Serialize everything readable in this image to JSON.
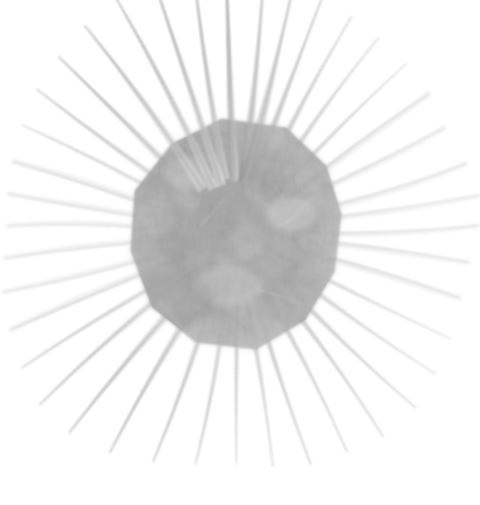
{
  "image": {
    "kind": "natural-image",
    "subject_name": "spiny-radiolarian-specimen",
    "description": "Faded grayscale specimen photograph of a spherical spiny organism with a polygonal central body and radiating needle-like spines",
    "background_color": "#ffffff",
    "width": 480,
    "height": 505,
    "has_text": false,
    "has_caption": false,
    "has_scale_bar": false,
    "has_border": false
  },
  "palette": {
    "background": "#ffffff",
    "body_dark": "#979797",
    "body_mid": "#acacac",
    "body_light": "#c4c4c4",
    "body_highlight": "#dcdcdc",
    "spine_strong": "#b4b4b4",
    "spine_mid": "#cdcdcd",
    "spine_faint": "#e2e2e2",
    "spine_ghost": "#f0f0f0",
    "edge_shadow": "#8e8e8e"
  },
  "body": {
    "name": "central-polygon-body",
    "center_x": 236,
    "center_y": 234,
    "radius_x": 105,
    "radius_y": 115,
    "sides": 9,
    "bounds": {
      "left": 130,
      "top": 119,
      "right": 341,
      "bottom": 351
    },
    "outline_points": "222,119 286,128 326,166 341,214 334,272 305,320 256,349 196,342 152,307 131,251 135,191 172,144",
    "fill_opacity": 0.82
  },
  "spines": [
    {
      "name": "spine-n-1",
      "angle": -92,
      "length": 196,
      "width": 5.0,
      "opacity": 0.62,
      "start_r": 96
    },
    {
      "name": "spine-n-2",
      "angle": -99,
      "length": 183,
      "width": 4.4,
      "opacity": 0.55,
      "start_r": 96
    },
    {
      "name": "spine-n-3",
      "angle": -84,
      "length": 178,
      "width": 5.5,
      "opacity": 0.58,
      "start_r": 96
    },
    {
      "name": "spine-n-4",
      "angle": -77,
      "length": 164,
      "width": 6.5,
      "opacity": 0.5,
      "start_r": 96
    },
    {
      "name": "spine-nne-1",
      "angle": -70,
      "length": 152,
      "width": 5.0,
      "opacity": 0.44,
      "start_r": 98
    },
    {
      "name": "spine-nne-2",
      "angle": -62,
      "length": 146,
      "width": 4.6,
      "opacity": 0.4,
      "start_r": 100
    },
    {
      "name": "spine-ne-1",
      "angle": -54,
      "length": 140,
      "width": 4.2,
      "opacity": 0.34,
      "start_r": 102
    },
    {
      "name": "spine-ne-2",
      "angle": -45,
      "length": 136,
      "width": 3.8,
      "opacity": 0.3,
      "start_r": 104
    },
    {
      "name": "spine-ene-1",
      "angle": -36,
      "length": 134,
      "width": 3.4,
      "opacity": 0.25,
      "start_r": 104
    },
    {
      "name": "spine-ene-2",
      "angle": -27,
      "length": 130,
      "width": 3.0,
      "opacity": 0.21,
      "start_r": 104
    },
    {
      "name": "spine-e-1",
      "angle": -17,
      "length": 136,
      "width": 2.8,
      "opacity": 0.18,
      "start_r": 104
    },
    {
      "name": "spine-e-2",
      "angle": -9,
      "length": 142,
      "width": 2.6,
      "opacity": 0.17,
      "start_r": 104
    },
    {
      "name": "spine-e-3",
      "angle": -2,
      "length": 138,
      "width": 2.6,
      "opacity": 0.16,
      "start_r": 104
    },
    {
      "name": "spine-ese-1",
      "angle": 7,
      "length": 130,
      "width": 2.8,
      "opacity": 0.18,
      "start_r": 104
    },
    {
      "name": "spine-ese-2",
      "angle": 16,
      "length": 128,
      "width": 3.2,
      "opacity": 0.21,
      "start_r": 104
    },
    {
      "name": "spine-se-1",
      "angle": 26,
      "length": 134,
      "width": 3.6,
      "opacity": 0.26,
      "start_r": 104
    },
    {
      "name": "spine-se-2",
      "angle": 35,
      "length": 142,
      "width": 3.8,
      "opacity": 0.3,
      "start_r": 102
    },
    {
      "name": "spine-se-3",
      "angle": 44,
      "length": 150,
      "width": 4.0,
      "opacity": 0.33,
      "start_r": 100
    },
    {
      "name": "spine-sse-1",
      "angle": 54,
      "length": 152,
      "width": 4.2,
      "opacity": 0.35,
      "start_r": 98
    },
    {
      "name": "spine-sse-2",
      "angle": 63,
      "length": 148,
      "width": 4.0,
      "opacity": 0.36,
      "start_r": 96
    },
    {
      "name": "spine-s-1",
      "angle": 72,
      "length": 146,
      "width": 4.2,
      "opacity": 0.38,
      "start_r": 96
    },
    {
      "name": "spine-s-2",
      "angle": 81,
      "length": 140,
      "width": 4.4,
      "opacity": 0.38,
      "start_r": 96
    },
    {
      "name": "spine-s-3",
      "angle": 90,
      "length": 134,
      "width": 4.0,
      "opacity": 0.34,
      "start_r": 96
    },
    {
      "name": "spine-ssw-1",
      "angle": 100,
      "length": 138,
      "width": 4.4,
      "opacity": 0.38,
      "start_r": 96
    },
    {
      "name": "spine-ssw-2",
      "angle": 110,
      "length": 146,
      "width": 5.0,
      "opacity": 0.42,
      "start_r": 96
    },
    {
      "name": "spine-sw-1",
      "angle": 120,
      "length": 156,
      "width": 5.4,
      "opacity": 0.45,
      "start_r": 96
    },
    {
      "name": "spine-sw-2",
      "angle": 130,
      "length": 164,
      "width": 5.6,
      "opacity": 0.46,
      "start_r": 96
    },
    {
      "name": "spine-sw-3",
      "angle": 139,
      "length": 162,
      "width": 5.0,
      "opacity": 0.42,
      "start_r": 98
    },
    {
      "name": "spine-wsw-1",
      "angle": 148,
      "length": 152,
      "width": 4.2,
      "opacity": 0.33,
      "start_r": 100
    },
    {
      "name": "spine-wsw-2",
      "angle": 157,
      "length": 142,
      "width": 3.4,
      "opacity": 0.24,
      "start_r": 102
    },
    {
      "name": "spine-w-1",
      "angle": 166,
      "length": 136,
      "width": 2.8,
      "opacity": 0.18,
      "start_r": 103
    },
    {
      "name": "spine-w-2",
      "angle": 174,
      "length": 130,
      "width": 2.6,
      "opacity": 0.16,
      "start_r": 103
    },
    {
      "name": "spine-w-3",
      "angle": -178,
      "length": 126,
      "width": 2.6,
      "opacity": 0.15,
      "start_r": 103
    },
    {
      "name": "spine-wnw-1",
      "angle": -170,
      "length": 128,
      "width": 2.8,
      "opacity": 0.17,
      "start_r": 103
    },
    {
      "name": "spine-wnw-2",
      "angle": -162,
      "length": 132,
      "width": 3.2,
      "opacity": 0.22,
      "start_r": 102
    },
    {
      "name": "spine-nw-1",
      "angle": -153,
      "length": 140,
      "width": 3.8,
      "opacity": 0.28,
      "start_r": 100
    },
    {
      "name": "spine-nw-2",
      "angle": -144,
      "length": 148,
      "width": 4.6,
      "opacity": 0.36,
      "start_r": 98
    },
    {
      "name": "spine-nw-3",
      "angle": -135,
      "length": 154,
      "width": 5.4,
      "opacity": 0.44,
      "start_r": 97
    },
    {
      "name": "spine-nnw-1",
      "angle": -126,
      "length": 162,
      "width": 5.6,
      "opacity": 0.5,
      "start_r": 96
    },
    {
      "name": "spine-nnw-2",
      "angle": -117,
      "length": 172,
      "width": 5.2,
      "opacity": 0.54,
      "start_r": 96
    },
    {
      "name": "spine-nnw-3",
      "angle": -108,
      "length": 186,
      "width": 4.8,
      "opacity": 0.58,
      "start_r": 96
    }
  ],
  "texture": {
    "name": "body-mottled-texture",
    "blob_count": 44,
    "streak_count": 26,
    "grain_opacity": 0.3,
    "noise_seed": 20240517
  }
}
